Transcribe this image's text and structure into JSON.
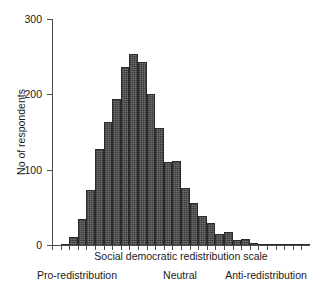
{
  "chart_data": {
    "type": "bar",
    "title": "",
    "subtitle": "",
    "xlabel": "Social democratic redistribution scale",
    "ylabel": "No of respondents",
    "ylim": [
      0,
      300
    ],
    "yticks": [
      0,
      100,
      200,
      300
    ],
    "ytick_labels": [
      "0",
      "100",
      "200",
      "300"
    ],
    "grid": false,
    "legend": null,
    "bar_color": "#5c5c5c",
    "bar_edge_color": "#2b2b2b",
    "axis_color": "#4d4d4d",
    "categories": [
      "1",
      "2",
      "3",
      "4",
      "5",
      "6",
      "7",
      "8",
      "9",
      "10",
      "11",
      "12",
      "13",
      "14",
      "15",
      "16",
      "17",
      "18",
      "19",
      "20",
      "21",
      "22",
      "23",
      "24",
      "25",
      "26",
      "27",
      "28",
      "29",
      "30"
    ],
    "values": [
      0,
      2,
      11,
      34,
      73,
      128,
      163,
      194,
      236,
      254,
      243,
      201,
      155,
      110,
      112,
      76,
      56,
      38,
      29,
      14,
      17,
      6,
      8,
      3,
      2,
      2,
      2,
      1,
      1,
      1
    ],
    "x_anchor_labels": [
      "Pro-redistribution",
      "Neutral",
      "Anti-redistribution"
    ]
  },
  "axes": {
    "y_axis_name": "No of respondents",
    "x_axis_name": "Social democratic redistribution scale"
  }
}
